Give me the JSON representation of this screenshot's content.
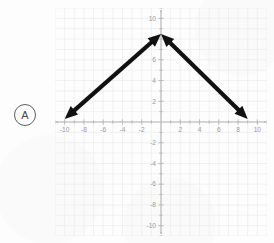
{
  "worksheet": {
    "item_label": "A"
  },
  "chart_data": {
    "type": "line",
    "title": "",
    "subtitle": "",
    "xlabel": "",
    "ylabel": "",
    "xlim": [
      -11,
      11
    ],
    "ylim": [
      -11,
      11
    ],
    "grid": true,
    "legend_position": "none",
    "x_ticks": [
      -10,
      -8,
      -6,
      -4,
      -2,
      2,
      4,
      6,
      8,
      10
    ],
    "y_ticks": [
      -10,
      -8,
      -6,
      -4,
      -2,
      2,
      4,
      6,
      8,
      10
    ],
    "x_tick_labels": [
      "-10",
      "-8",
      "-6",
      "-4",
      "-2",
      "2",
      "4",
      "6",
      "8",
      "10"
    ],
    "y_tick_labels": [
      "-10",
      "-8",
      "-6",
      "-4",
      "-2",
      "2",
      "4",
      "6",
      "8",
      "10"
    ],
    "gridline_step": 1,
    "tick_step": 2,
    "annotations": [
      "A"
    ],
    "series": [
      {
        "name": "left-branch",
        "style": "double-headed-arrow",
        "color": "#111111",
        "width": 4.2,
        "x": [
          -10.0,
          0.0
        ],
        "y": [
          0.3,
          8.5
        ],
        "arrow_start": true,
        "arrow_end": true
      },
      {
        "name": "right-branch",
        "style": "double-headed-arrow",
        "color": "#111111",
        "width": 4.2,
        "x": [
          0.0,
          9.0
        ],
        "y": [
          8.5,
          0.3
        ],
        "arrow_start": true,
        "arrow_end": true
      }
    ],
    "vertex": {
      "x": 0,
      "y": 8.5
    }
  },
  "colors": {
    "background": "#fdfdfd",
    "axis": "#b4b4b4",
    "grid": "#ededed",
    "tick_text": "#9a9a9a",
    "curve": "#111111",
    "label_outline": "#5d5d5d"
  }
}
